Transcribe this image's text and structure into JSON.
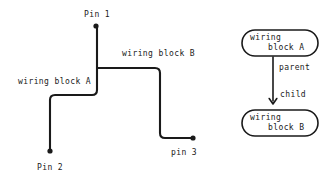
{
  "diagram": {
    "title_present": false,
    "background_color": "#ffffff",
    "stroke_color": "#1a1a1a",
    "wiring": {
      "pins": [
        {
          "id": "pin-1",
          "label": "Pin 1",
          "x": 96,
          "y": 26,
          "label_x": 84,
          "label_y": 10
        },
        {
          "id": "pin-2",
          "label": "Pin 2",
          "x": 50,
          "y": 151,
          "label_x": 37,
          "label_y": 163
        },
        {
          "id": "pin-3",
          "label": "pin 3",
          "x": 193,
          "y": 138,
          "label_x": 171,
          "label_y": 148
        }
      ],
      "blocks": [
        {
          "id": "wiring-block-a",
          "label": "wiring block A",
          "label_x": 18,
          "label_y": 77
        },
        {
          "id": "wiring-block-b",
          "label": "wiring block B",
          "label_x": 122,
          "label_y": 49
        }
      ]
    },
    "graph": {
      "nodes": [
        {
          "id": "node-wiring-block-a",
          "line1": "wiring",
          "line2": "block A",
          "x": 242,
          "y": 30,
          "w": 76,
          "h": 26
        },
        {
          "id": "node-wiring-block-b",
          "line1": "wiring",
          "line2": "block B",
          "x": 242,
          "y": 110,
          "w": 76,
          "h": 26
        }
      ],
      "edges": [
        {
          "id": "edge-parent-child",
          "from": "node-wiring-block-a",
          "to": "node-wiring-block-b",
          "labels": [
            {
              "id": "edge-label-parent",
              "text": "parent",
              "x": 279,
              "y": 63
            },
            {
              "id": "edge-label-child",
              "text": "child",
              "x": 280,
              "y": 90
            }
          ]
        }
      ]
    }
  }
}
